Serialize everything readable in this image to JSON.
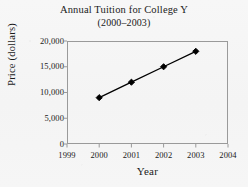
{
  "chart_data": {
    "type": "line",
    "title": "Annual Tuition for College Y",
    "subtitle": "(2000–2003)",
    "xlabel": "Year",
    "ylabel": "Price (dollars)",
    "x": [
      2000,
      2001,
      2002,
      2003
    ],
    "values": [
      9000,
      12000,
      15000,
      18000
    ],
    "series": [
      {
        "name": "Annual Tuition",
        "values": [
          9000,
          12000,
          15000,
          18000
        ]
      }
    ],
    "points": [
      {
        "x": 2000,
        "y": 9000,
        "label": "2000",
        "value_label": "9,000"
      },
      {
        "x": 2001,
        "y": 12000,
        "label": "2001",
        "value_label": "12,000"
      },
      {
        "x": 2002,
        "y": 15000,
        "label": "2002",
        "value_label": "15,000"
      },
      {
        "x": 2003,
        "y": 18000,
        "label": "2003",
        "value_label": "18,000"
      }
    ],
    "xlim": [
      1999,
      2004
    ],
    "ylim": [
      0,
      20000
    ],
    "x_ticks": [
      1999,
      2000,
      2001,
      2002,
      2003,
      2004
    ],
    "x_tick_labels": [
      "1999",
      "2000",
      "2001",
      "2002",
      "2003",
      "2004"
    ],
    "y_ticks": [
      0,
      5000,
      10000,
      15000,
      20000
    ],
    "y_tick_labels": [
      "0",
      "5,000",
      "10,000",
      "15,000",
      "20,000"
    ],
    "grid": false,
    "legend": false,
    "marker": "diamond",
    "line_color": "#000000",
    "marker_color": "#000000",
    "axis_color": "#9a9a9a",
    "background_color": "#f6f6f6"
  }
}
